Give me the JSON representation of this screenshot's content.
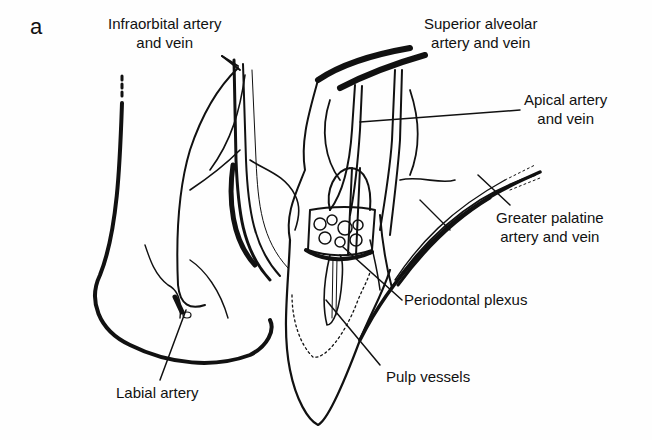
{
  "figure": {
    "panel_letter": "a",
    "labels": {
      "infraorbital": {
        "line1": "Infraorbital artery",
        "line2": "and vein"
      },
      "superior_alveolar": {
        "line1": "Superior alveolar",
        "line2": "artery and vein"
      },
      "apical": {
        "line1": "Apical artery",
        "line2": "and vein"
      },
      "greater_palatine": {
        "line1": "Greater palatine",
        "line2": "artery and vein"
      },
      "periodontal": {
        "line1": "Periodontal plexus"
      },
      "pulp": {
        "line1": "Pulp vessels"
      },
      "labial": {
        "line1": "Labial artery"
      }
    },
    "colors": {
      "ink": "#111111",
      "paper": "#fefefe"
    }
  }
}
